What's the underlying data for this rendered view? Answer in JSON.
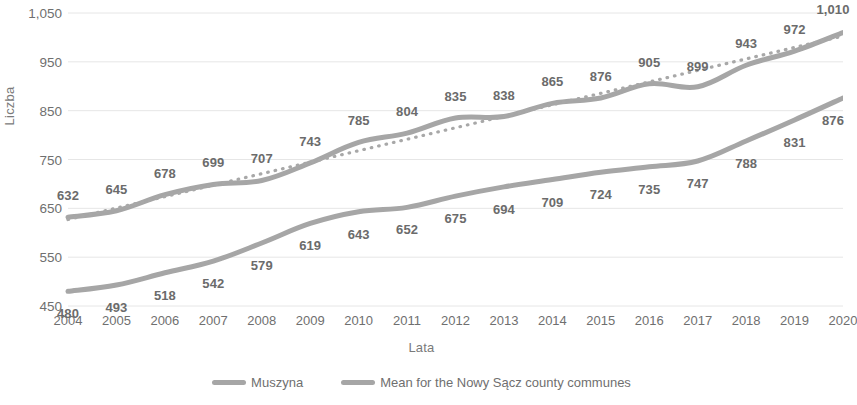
{
  "chart_data": {
    "type": "line",
    "title": "",
    "xlabel": "Lata",
    "ylabel": "Liczba",
    "x": [
      2004,
      2005,
      2006,
      2007,
      2008,
      2009,
      2010,
      2011,
      2012,
      2013,
      2014,
      2015,
      2016,
      2017,
      2018,
      2019,
      2020
    ],
    "categories": [
      "2004",
      "2005",
      "2006",
      "2007",
      "2008",
      "2009",
      "2010",
      "2011",
      "2012",
      "2013",
      "2014",
      "2015",
      "2016",
      "2017",
      "2018",
      "2019",
      "2020"
    ],
    "ylim": [
      450,
      1050
    ],
    "yticks": [
      450,
      550,
      650,
      750,
      850,
      950,
      1050
    ],
    "ytick_labels": [
      "450",
      "550",
      "650",
      "750",
      "850",
      "950",
      "1,050"
    ],
    "grid": true,
    "legend_position": "bottom",
    "series": [
      {
        "name": "Muszyna",
        "color": "#a6a6a6",
        "values": [
          632,
          645,
          678,
          699,
          707,
          743,
          785,
          804,
          835,
          838,
          865,
          876,
          905,
          899,
          943,
          972,
          1010
        ],
        "labels": [
          "632",
          "645",
          "678",
          "699",
          "707",
          "743",
          "785",
          "804",
          "835",
          "838",
          "865",
          "876",
          "905",
          "899",
          "943",
          "972",
          "1,010"
        ]
      },
      {
        "name": "Mean for the Nowy Sącz county communes",
        "color": "#a6a6a6",
        "values": [
          480,
          493,
          518,
          542,
          579,
          619,
          643,
          652,
          675,
          694,
          709,
          724,
          735,
          747,
          788,
          831,
          876
        ],
        "labels": [
          "480",
          "493",
          "518",
          "542",
          "579",
          "619",
          "643",
          "652",
          "675",
          "694",
          "709",
          "724",
          "735",
          "747",
          "788",
          "831",
          "876"
        ]
      }
    ],
    "trendline": {
      "name": "Muszyna trendline",
      "style": "dotted",
      "color": "#a8a8a8",
      "for_series": "Muszyna",
      "start_value": 627,
      "end_value": 1003
    },
    "colors": {
      "line": "#a6a6a6",
      "grid": "#e6e6e6",
      "text": "#6f6f6f"
    }
  }
}
